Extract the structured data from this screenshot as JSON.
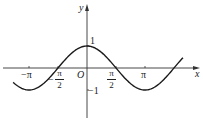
{
  "chart_data": {
    "type": "line",
    "title": "",
    "function": "y = cos x",
    "xlabel": "x",
    "ylabel": "y",
    "origin_label": "O",
    "x_ticks": [
      {
        "value": -3.14159,
        "label": "−π"
      },
      {
        "value": -1.5708,
        "label": "−π/2",
        "num": "π",
        "den": "2",
        "sign": "−"
      },
      {
        "value": 1.5708,
        "label": "π/2",
        "num": "π",
        "den": "2",
        "sign": ""
      },
      {
        "value": 3.14159,
        "label": "π"
      }
    ],
    "y_ticks": [
      {
        "value": 1,
        "label": "1"
      },
      {
        "value": -1,
        "label": "−1"
      }
    ],
    "xlim": [
      -4.1,
      5.2
    ],
    "ylim": [
      -1.5,
      1.9
    ],
    "grid": false,
    "legend": "none",
    "series": [
      {
        "name": "cos x",
        "color": "#1a1a1a",
        "x_range": [
          -4.0,
          5.2
        ]
      }
    ]
  },
  "labels": {
    "y_axis": "y",
    "x_axis": "x",
    "origin": "O",
    "one": "1",
    "neg_one": "−1",
    "neg_pi": "−π",
    "pi": "π",
    "half_num": "π",
    "half_den": "2",
    "minus": "−"
  }
}
